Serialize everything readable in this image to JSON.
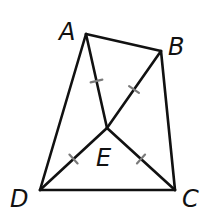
{
  "diagram": {
    "type": "geometry-figure",
    "points": [
      {
        "id": "A",
        "label": "A"
      },
      {
        "id": "B",
        "label": "B"
      },
      {
        "id": "C",
        "label": "C"
      },
      {
        "id": "D",
        "label": "D"
      },
      {
        "id": "E",
        "label": "E"
      }
    ],
    "segments": [
      {
        "from": "A",
        "to": "B",
        "congruence_ticks": 0
      },
      {
        "from": "B",
        "to": "C",
        "congruence_ticks": 0
      },
      {
        "from": "C",
        "to": "D",
        "congruence_ticks": 0
      },
      {
        "from": "D",
        "to": "A",
        "congruence_ticks": 0
      },
      {
        "from": "A",
        "to": "E",
        "congruence_ticks": 1
      },
      {
        "from": "B",
        "to": "E",
        "congruence_ticks": 1
      },
      {
        "from": "D",
        "to": "E",
        "congruence_ticks": 1
      },
      {
        "from": "C",
        "to": "E",
        "congruence_ticks": 1
      }
    ],
    "colors": {
      "line": "#111111",
      "tick": "#7a7a7a",
      "background": "#ffffff"
    }
  }
}
